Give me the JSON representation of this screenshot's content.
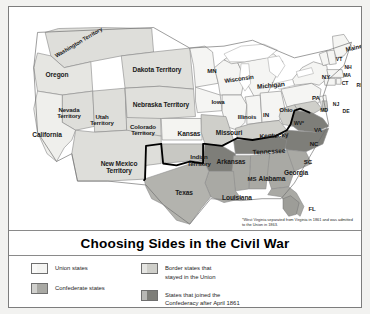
{
  "title": "Choosing Sides in the Civil War",
  "footnote": "*West Virginia separated from Virginia in 1861 and was admitted to the Union in 1863.",
  "legend": {
    "items": [
      {
        "label_line1": "Union states",
        "label_line2": "",
        "color": "#f4f4f2",
        "key": "union"
      },
      {
        "label_line1": "Confederate states",
        "label_line2": "",
        "color": "#a9a9a4",
        "key": "confederate"
      },
      {
        "label_line1": "Border states that",
        "label_line2": "stayed in the Union",
        "color": "#cfcfca",
        "key": "border"
      },
      {
        "label_line1": "States that joined the",
        "label_line2": "Confederacy after April 1861",
        "color": "#7e7e79",
        "key": "joined-after-april-1861"
      }
    ]
  },
  "colors": {
    "union": "#f4f4f2",
    "confederate": "#a9a9a4",
    "border": "#cfcfca",
    "joined_after": "#7e7e79",
    "territory": "#dededa",
    "lake": "#ffffff",
    "outline": "#8c8c8c",
    "heavy_border": "#000000",
    "background": "#ffffff"
  },
  "map": {
    "labels": [
      {
        "text": "Washington Territory",
        "x": 70,
        "y": 36,
        "size": "s55",
        "rotate": -31
      },
      {
        "text": "Oregon",
        "x": 48,
        "y": 68,
        "size": "s65",
        "rotate": 0
      },
      {
        "text": "Dakota Territory",
        "x": 148,
        "y": 63,
        "size": "s65",
        "rotate": 0
      },
      {
        "text": "MN",
        "x": 203,
        "y": 64,
        "size": "s6",
        "rotate": 0
      },
      {
        "text": "Wisconsin",
        "x": 230,
        "y": 72,
        "size": "s6",
        "rotate": -8
      },
      {
        "text": "Michigan",
        "x": 262,
        "y": 79,
        "size": "s65",
        "rotate": -6
      },
      {
        "text": "Maine",
        "x": 345,
        "y": 41,
        "size": "s6",
        "rotate": -14
      },
      {
        "text": "VT",
        "x": 330,
        "y": 53,
        "size": "s5",
        "rotate": 0
      },
      {
        "text": "NH",
        "x": 339,
        "y": 61,
        "size": "s5",
        "rotate": 0
      },
      {
        "text": "NY",
        "x": 317,
        "y": 70,
        "size": "s6",
        "rotate": 0
      },
      {
        "text": "MA",
        "x": 338,
        "y": 69,
        "size": "s5",
        "rotate": 0
      },
      {
        "text": "CT",
        "x": 336,
        "y": 77,
        "size": "s5",
        "rotate": 0
      },
      {
        "text": "RI",
        "x": 350,
        "y": 79,
        "size": "s5",
        "rotate": 0
      },
      {
        "text": "Nevada",
        "x": 60,
        "y": 103,
        "size": "s6",
        "rotate": 0
      },
      {
        "text": "Territory",
        "x": 60,
        "y": 109,
        "size": "s6",
        "rotate": 0
      },
      {
        "text": "Utah",
        "x": 93,
        "y": 110,
        "size": "s6",
        "rotate": 0
      },
      {
        "text": "Territory",
        "x": 93,
        "y": 116,
        "size": "s6",
        "rotate": 0
      },
      {
        "text": "Colorado",
        "x": 134,
        "y": 120,
        "size": "s6",
        "rotate": 0
      },
      {
        "text": "Territory",
        "x": 134,
        "y": 126,
        "size": "s6",
        "rotate": 0
      },
      {
        "text": "Nebraska Territory",
        "x": 152,
        "y": 98,
        "size": "s65",
        "rotate": 0
      },
      {
        "text": "Iowa",
        "x": 209,
        "y": 95,
        "size": "s6",
        "rotate": 0
      },
      {
        "text": "Illinois",
        "x": 238,
        "y": 110,
        "size": "s6",
        "rotate": 0
      },
      {
        "text": "IN",
        "x": 257,
        "y": 108,
        "size": "s6",
        "rotate": 0
      },
      {
        "text": "Ohio",
        "x": 277,
        "y": 103,
        "size": "s6",
        "rotate": 0
      },
      {
        "text": "PA",
        "x": 307,
        "y": 91,
        "size": "s6",
        "rotate": 0
      },
      {
        "text": "NJ",
        "x": 327,
        "y": 98,
        "size": "s5",
        "rotate": 0
      },
      {
        "text": "MD",
        "x": 315,
        "y": 104,
        "size": "s5",
        "rotate": 0
      },
      {
        "text": "DE",
        "x": 337,
        "y": 105,
        "size": "s5",
        "rotate": 0
      },
      {
        "text": "WV*",
        "x": 290,
        "y": 117,
        "size": "s5",
        "rotate": 0
      },
      {
        "text": "VA",
        "x": 309,
        "y": 123,
        "size": "s6",
        "rotate": 0
      },
      {
        "text": "California",
        "x": 38,
        "y": 128,
        "size": "s65",
        "rotate": 0
      },
      {
        "text": "Kansas",
        "x": 180,
        "y": 127,
        "size": "s65",
        "rotate": 0
      },
      {
        "text": "Missouri",
        "x": 220,
        "y": 126,
        "size": "s65",
        "rotate": 0
      },
      {
        "text": "Kentucky",
        "x": 265,
        "y": 129,
        "size": "s65",
        "rotate": -4
      },
      {
        "text": "NC",
        "x": 305,
        "y": 137,
        "size": "s6",
        "rotate": 0
      },
      {
        "text": "New Mexico",
        "x": 110,
        "y": 157,
        "size": "s65",
        "rotate": 0
      },
      {
        "text": "Territory",
        "x": 110,
        "y": 164,
        "size": "s65",
        "rotate": 0
      },
      {
        "text": "Indian",
        "x": 190,
        "y": 150,
        "size": "s6",
        "rotate": 0
      },
      {
        "text": "Territory",
        "x": 190,
        "y": 157,
        "size": "s6",
        "rotate": 0
      },
      {
        "text": "Arkansas",
        "x": 222,
        "y": 155,
        "size": "s65",
        "rotate": 0
      },
      {
        "text": "Tennessee",
        "x": 260,
        "y": 145,
        "size": "s65",
        "rotate": -3
      },
      {
        "text": "SC",
        "x": 299,
        "y": 155,
        "size": "s6",
        "rotate": 0
      },
      {
        "text": "MS",
        "x": 243,
        "y": 172,
        "size": "s6",
        "rotate": 0
      },
      {
        "text": "Alabama",
        "x": 263,
        "y": 172,
        "size": "s65",
        "rotate": 0
      },
      {
        "text": "Georgia",
        "x": 287,
        "y": 166,
        "size": "s65",
        "rotate": 0
      },
      {
        "text": "Texas",
        "x": 175,
        "y": 186,
        "size": "s65",
        "rotate": 0
      },
      {
        "text": "Louisiana",
        "x": 228,
        "y": 191,
        "size": "s65",
        "rotate": 0
      },
      {
        "text": "FL",
        "x": 303,
        "y": 202,
        "size": "s6",
        "rotate": 0
      }
    ]
  }
}
